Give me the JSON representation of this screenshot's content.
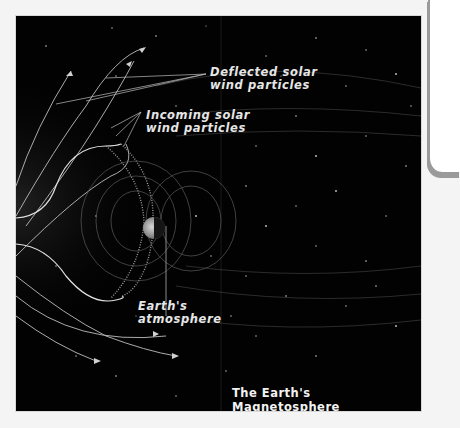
{
  "figure": {
    "title": "The Earth's Magnetosphere",
    "labels": {
      "deflected": "Deflected solar\nwind particles",
      "incoming": "Incoming solar\nwind particles",
      "atmosphere": "Earth's\natmosphere"
    },
    "icons": {
      "earth": "earth-globe-icon",
      "arrows": "flow-arrow-icon"
    },
    "colors": {
      "background": "#020202",
      "lines": "#bdbdbd",
      "text": "#e6e6e6",
      "page": "#f4f4f4"
    }
  }
}
